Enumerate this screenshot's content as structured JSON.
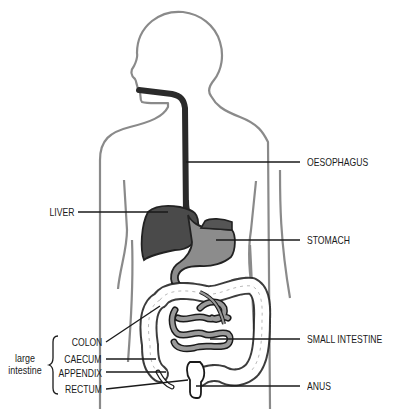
{
  "colors": {
    "outline": "#8a8a8a",
    "oesophagus": "#2f2f2f",
    "liver": "#4a4a4a",
    "stomach": "#8c8c8c",
    "small_intestine": "#9a9a9a",
    "colon_fill": "#ffffff",
    "leader": "#1a1a1a"
  },
  "labels": {
    "oesophagus": "OESOPHAGUS",
    "liver": "LIVER",
    "stomach": "STOMACH",
    "colon": "COLON",
    "caecum": "CAECUM",
    "appendix": "APPENDIX",
    "rectum": "RECTUM",
    "small_intestine": "SMALL INTESTINE",
    "anus": "ANUS"
  },
  "group": {
    "line1": "large",
    "line2": "intestine"
  }
}
